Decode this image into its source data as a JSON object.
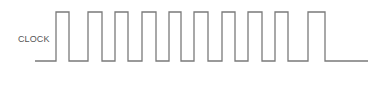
{
  "diagram": {
    "type": "timing-diagram",
    "signal": {
      "label": "CLOCK",
      "line_color": "#7a7a7a",
      "low_y": 61,
      "high_y": 12,
      "start_x": 35,
      "end_x": 368,
      "pulses": [
        {
          "rise": 56,
          "fall": 69
        },
        {
          "rise": 88,
          "fall": 102
        },
        {
          "rise": 115,
          "fall": 128
        },
        {
          "rise": 142,
          "fall": 156
        },
        {
          "rise": 169,
          "fall": 181
        },
        {
          "rise": 194,
          "fall": 208
        },
        {
          "rise": 222,
          "fall": 235
        },
        {
          "rise": 248,
          "fall": 262
        },
        {
          "rise": 275,
          "fall": 288
        },
        {
          "rise": 308,
          "fall": 325
        }
      ]
    }
  }
}
